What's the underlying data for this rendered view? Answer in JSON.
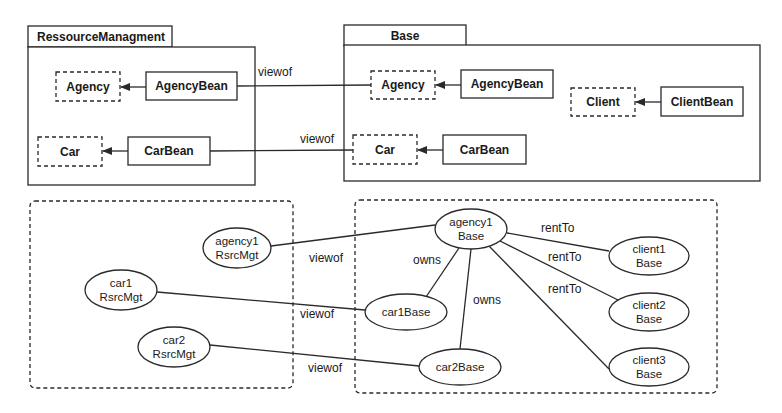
{
  "diagram": {
    "packages": [
      {
        "id": "ressource_managment",
        "name": "RessourceManagment",
        "elements": [
          {
            "id": "rm_agency",
            "label": "Agency",
            "style": "dashed"
          },
          {
            "id": "rm_agencybean",
            "label": "AgencyBean",
            "style": "solid"
          },
          {
            "id": "rm_car",
            "label": "Car",
            "style": "dashed"
          },
          {
            "id": "rm_carbean",
            "label": "CarBean",
            "style": "solid"
          }
        ]
      },
      {
        "id": "base",
        "name": "Base",
        "elements": [
          {
            "id": "b_agency",
            "label": "Agency",
            "style": "dashed"
          },
          {
            "id": "b_agencybean",
            "label": "AgencyBean",
            "style": "solid"
          },
          {
            "id": "b_client",
            "label": "Client",
            "style": "dashed"
          },
          {
            "id": "b_clientbean",
            "label": "ClientBean",
            "style": "solid"
          },
          {
            "id": "b_car",
            "label": "Car",
            "style": "dashed"
          },
          {
            "id": "b_carbean",
            "label": "CarBean",
            "style": "solid"
          }
        ]
      }
    ],
    "package_edges": [
      {
        "from": "rm_agencybean",
        "to": "rm_agency",
        "arrow": true
      },
      {
        "from": "rm_carbean",
        "to": "rm_car",
        "arrow": true
      },
      {
        "from": "b_agencybean",
        "to": "b_agency",
        "arrow": true
      },
      {
        "from": "b_clientbean",
        "to": "b_client",
        "arrow": true
      },
      {
        "from": "b_carbean",
        "to": "b_car",
        "arrow": true
      },
      {
        "from": "rm_agencybean",
        "to": "b_agency",
        "label": "viewof"
      },
      {
        "from": "rm_carbean",
        "to": "b_car",
        "label": "viewof"
      }
    ],
    "labels": {
      "viewof": "viewof",
      "owns": "owns",
      "rentTo": "rentTo"
    },
    "instances": {
      "agency1_rsrcmgt": {
        "line1": "agency1",
        "line2": "RsrcMgt"
      },
      "car1_rsrcmgt": {
        "line1": "car1",
        "line2": "RsrcMgt"
      },
      "car2_rsrcmgt": {
        "line1": "car2",
        "line2": "RsrcMgt"
      },
      "agency1_base": {
        "line1": "agency1",
        "line2": "Base"
      },
      "car1_base": {
        "line1": "car1Base"
      },
      "car2_base": {
        "line1": "car2Base"
      },
      "client1_base": {
        "line1": "client1",
        "line2": "Base"
      },
      "client2_base": {
        "line1": "client2",
        "line2": "Base"
      },
      "client3_base": {
        "line1": "client3",
        "line2": "Base"
      }
    },
    "instance_edges": [
      {
        "from": "agency1_rsrcmgt",
        "to": "agency1_base",
        "label": "viewof"
      },
      {
        "from": "car1_rsrcmgt",
        "to": "car1_base",
        "label": "viewof"
      },
      {
        "from": "car2_rsrcmgt",
        "to": "car2_base",
        "label": "viewof"
      },
      {
        "from": "agency1_base",
        "to": "car1_base",
        "label": "owns"
      },
      {
        "from": "agency1_base",
        "to": "car2_base",
        "label": "owns"
      },
      {
        "from": "agency1_base",
        "to": "client1_base",
        "label": "rentTo"
      },
      {
        "from": "agency1_base",
        "to": "client2_base",
        "label": "rentTo"
      },
      {
        "from": "agency1_base",
        "to": "client3_base",
        "label": "rentTo"
      }
    ],
    "colors": {
      "line": "#2a2a2a",
      "background": "#ffffff",
      "text": "#1a1a1a"
    }
  }
}
